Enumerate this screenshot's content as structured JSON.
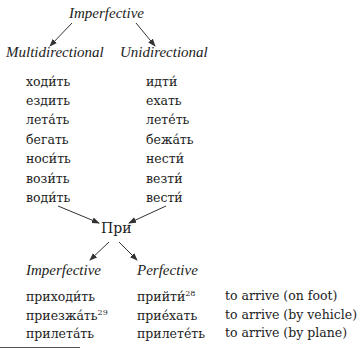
{
  "header": {
    "title": "Imperfective"
  },
  "branches": {
    "left": "Multidirectional",
    "right": "Unidirectional"
  },
  "multidirectional_verbs": [
    "ходи́ть",
    "ездить",
    "лета́ть",
    "бегать",
    "носи́ть",
    "вози́ть",
    "води́ть"
  ],
  "unidirectional_verbs": [
    "идти́",
    "ехать",
    "лете́ть",
    "бежа́ть",
    "нести́",
    "везти́",
    "вести́"
  ],
  "prefix": "При",
  "aspects": {
    "left": "Imperfective",
    "right": "Perfective"
  },
  "derived": [
    {
      "imperfective": "приходи́ть",
      "imp_note": "",
      "perfective": "прийти́",
      "perf_note": "28",
      "meaning": "to arrive (on foot)"
    },
    {
      "imperfective": "приезжа́ть",
      "imp_note": "29",
      "perfective": "прие́хать",
      "perf_note": "",
      "meaning": "to arrive (by vehicle)"
    },
    {
      "imperfective": "прилета́ть",
      "imp_note": "",
      "perfective": "прилете́ть",
      "perf_note": "",
      "meaning": "to arrive (by plane)"
    }
  ]
}
